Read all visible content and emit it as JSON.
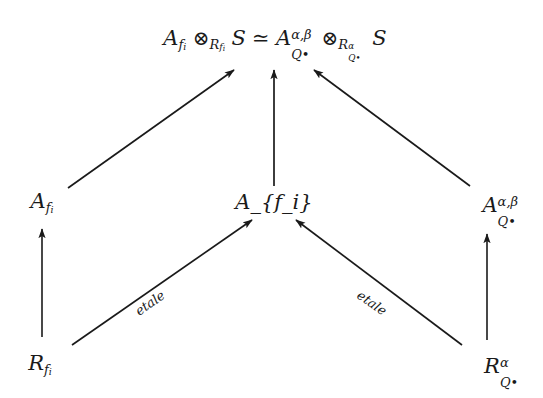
{
  "diagram": {
    "type": "commutative-diagram",
    "background_color": "#ffffff",
    "ink_color": "#1a1a1a",
    "width": 543,
    "height": 398,
    "nodes": [
      {
        "id": "top-isomorphism",
        "role": "top-formula",
        "latex": "A_{f_i} \\otimes_{R_{f_i}} S \\simeq A_{Q^\\bullet}^{\\alpha,\\beta} \\otimes_{R_{Q^\\bullet}^{\\alpha}} S",
        "plain": "A_{f_i} ⊗_{R_{f_i}} S ≃ A_{Q•}^{α,β} ⊗_{R_{Q•}^{α}} S",
        "x": 275,
        "y": 40,
        "parts": {
          "A": "A",
          "f_i": "f",
          "i": "i",
          "otimes": "⊗",
          "R": "R",
          "S": "S",
          "simeq": "≃",
          "alpha": "α",
          "beta": "β",
          "comma": ",",
          "Q": "Q",
          "bullet": "•"
        }
      },
      {
        "id": "A-fi",
        "role": "middle-left",
        "latex": "A_{f_i}",
        "plain": "A_{f_i}",
        "x": 42,
        "y": 203
      },
      {
        "id": "S",
        "role": "middle-center",
        "latex": "S",
        "plain": "S",
        "x": 274,
        "y": 202
      },
      {
        "id": "A-Q-alpha-beta",
        "role": "middle-right",
        "latex": "A_{Q^\\bullet}^{\\alpha,\\beta}",
        "plain": "A_{Q•}^{α,β}",
        "x": 490,
        "y": 205
      },
      {
        "id": "R-fi",
        "role": "bottom-left",
        "latex": "R_{f_i}",
        "plain": "R_{f_i}",
        "x": 40,
        "y": 365
      },
      {
        "id": "R-Q-alpha",
        "role": "bottom-right",
        "latex": "R_{Q^\\bullet}^{\\alpha}",
        "plain": "R_{Q•}^{α}",
        "x": 492,
        "y": 366
      }
    ],
    "edges": [
      {
        "id": "edge-Afi-to-top",
        "from": "A-fi",
        "to": "top-isomorphism",
        "label": "",
        "x1": 68,
        "y1": 188,
        "x2": 234,
        "y2": 70
      },
      {
        "id": "edge-S-to-top",
        "from": "S",
        "to": "top-isomorphism",
        "label": "",
        "x1": 274,
        "y1": 186,
        "x2": 274,
        "y2": 70
      },
      {
        "id": "edge-AQ-to-top",
        "from": "A-Q-alpha-beta",
        "to": "top-isomorphism",
        "label": "",
        "x1": 470,
        "y1": 186,
        "x2": 314,
        "y2": 70
      },
      {
        "id": "edge-Rfi-to-Afi",
        "from": "R-fi",
        "to": "A-fi",
        "label": "",
        "x1": 42,
        "y1": 337,
        "x2": 42,
        "y2": 229
      },
      {
        "id": "edge-Rfi-to-S",
        "from": "R-fi",
        "to": "S",
        "label": "etale",
        "label_x": 150,
        "label_y": 303,
        "label_rotation": -35,
        "x1": 72,
        "y1": 345,
        "x2": 252,
        "y2": 220
      },
      {
        "id": "edge-RQ-to-AQ",
        "from": "R-Q-alpha",
        "to": "A-Q-alpha-beta",
        "label": "",
        "x1": 487,
        "y1": 340,
        "x2": 487,
        "y2": 234
      },
      {
        "id": "edge-RQ-to-S",
        "from": "R-Q-alpha",
        "to": "S",
        "label": "etale",
        "label_x": 372,
        "label_y": 303,
        "label_rotation": 35,
        "x1": 462,
        "y1": 345,
        "x2": 296,
        "y2": 220
      }
    ]
  }
}
